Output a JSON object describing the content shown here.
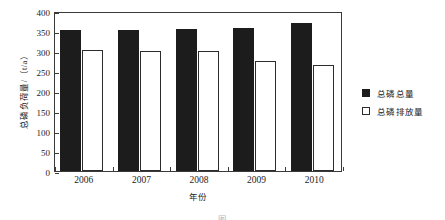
{
  "chart_data": {
    "type": "bar",
    "title": "",
    "categories": [
      "2006",
      "2007",
      "2008",
      "2009",
      "2010"
    ],
    "series": [
      {
        "name": "总磷总量",
        "values": [
          353,
          352,
          354,
          358,
          370
        ],
        "style": "filled-black"
      },
      {
        "name": "总磷排放量",
        "values": [
          303,
          301,
          299,
          275,
          265
        ],
        "style": "hollow-white"
      }
    ],
    "xlabel": "年份",
    "ylabel": "总磷负荷量/（t/a）",
    "ylim": [
      0,
      400
    ],
    "yticks": [
      "0",
      "50",
      "100",
      "150",
      "200",
      "250",
      "300",
      "350",
      "400"
    ],
    "ytick_values": [
      0,
      50,
      100,
      150,
      200,
      250,
      300,
      350,
      400
    ],
    "grid": false,
    "legend_position": "right"
  },
  "legend": {
    "items": [
      {
        "label": "总磷总量",
        "swatch": "filled-square-icon"
      },
      {
        "label": "总磷排放量",
        "swatch": "hollow-square-icon"
      }
    ]
  },
  "caption": "图"
}
